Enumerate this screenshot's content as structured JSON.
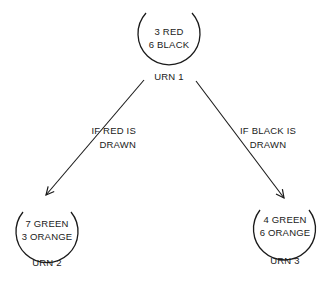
{
  "diagram": {
    "colors": {
      "stroke": "#1a1a1a",
      "background": "#ffffff"
    },
    "urns": [
      {
        "name": "URN 1",
        "line1": "3 RED",
        "line2": "6 BLACK"
      },
      {
        "name": "URN 2",
        "line1": "7 GREEN",
        "line2": "3 ORANGE"
      },
      {
        "name": "URN 3",
        "line1": "4 GREEN",
        "line2": "6 ORANGE"
      }
    ],
    "arrows": [
      {
        "from": "URN 1",
        "to": "URN 2",
        "label_line1": "IF RED IS",
        "label_line2": "DRAWN"
      },
      {
        "from": "URN 1",
        "to": "URN 3",
        "label_line1": "IF BLACK IS",
        "label_line2": "DRAWN"
      }
    ]
  }
}
